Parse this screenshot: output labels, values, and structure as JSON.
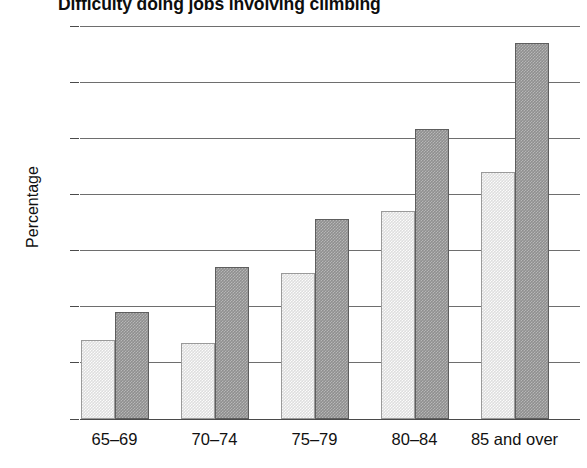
{
  "chart_data": {
    "type": "bar",
    "title": "Difficulty doing jobs involving climbing",
    "xlabel": "",
    "ylabel": "Percentage",
    "categories": [
      "65–69",
      "70–74",
      "75–79",
      "80–84",
      "85 and over"
    ],
    "ylim": [
      0,
      70
    ],
    "yticks": [
      0,
      10,
      20,
      30,
      40,
      50,
      60,
      70
    ],
    "ytick_labels": [
      "0",
      "10",
      "20",
      "30",
      "40",
      "50",
      "60",
      "70"
    ],
    "grid": true,
    "legend": "none",
    "series": [
      {
        "name": "series-1",
        "style": "light-gray",
        "color": "#dedede",
        "values": [
          14,
          13.5,
          26,
          37,
          44
        ]
      },
      {
        "name": "series-2",
        "style": "dark-gray",
        "color": "#8f8f8f",
        "values": [
          19,
          27,
          35.7,
          51.6,
          67
        ]
      }
    ]
  },
  "colors": {
    "light_bar": "#dedede",
    "dark_bar": "#8f8f8f",
    "gridline": "#6e6e6e",
    "axis": "#4a4a4a",
    "text": "#111111",
    "background": "#ffffff"
  }
}
